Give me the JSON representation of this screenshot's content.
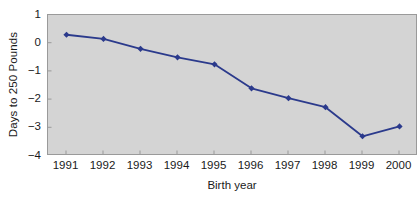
{
  "chart_data": {
    "type": "line",
    "title": "",
    "xlabel": "Birth year",
    "ylabel": "Days to 250 Pounds",
    "categories": [
      "1991",
      "1992",
      "1993",
      "1994",
      "1995",
      "1996",
      "1997",
      "1998",
      "1999",
      "2000"
    ],
    "x": [
      1991,
      1992,
      1993,
      1994,
      1995,
      1996,
      1997,
      1998,
      1999,
      2000
    ],
    "values": [
      0.3,
      0.15,
      -0.2,
      -0.5,
      -0.75,
      -1.6,
      -1.95,
      -2.27,
      -3.3,
      -2.95
    ],
    "series": [
      {
        "name": "Days to 250 Pounds",
        "values": [
          0.3,
          0.15,
          -0.2,
          -0.5,
          -0.75,
          -1.6,
          -1.95,
          -2.27,
          -3.3,
          -2.95
        ]
      }
    ],
    "ylim": [
      -4,
      1
    ],
    "xlim": [
      1990.5,
      2000.5
    ],
    "yticks": [
      1,
      0,
      -1,
      -2,
      -3,
      -4
    ],
    "ytick_labels": [
      "1",
      "0",
      "−1",
      "−2",
      "−3",
      "−4"
    ],
    "xticks": [
      1991,
      1992,
      1993,
      1994,
      1995,
      1996,
      1997,
      1998,
      1999,
      2000
    ],
    "xtick_labels": [
      "1991",
      "1992",
      "1993",
      "1994",
      "1995",
      "1996",
      "1997",
      "1998",
      "1999",
      "2000"
    ],
    "grid": false,
    "legend": false,
    "legend_position": "none",
    "marker": "diamond",
    "colors": {
      "line": "#2b3a8c",
      "marker": "#2b3a8c",
      "plot_background": "#d4d4d4",
      "figure_background": "#ffffff",
      "axis": "#9a9a9a",
      "text": "#1a1a1a"
    }
  }
}
